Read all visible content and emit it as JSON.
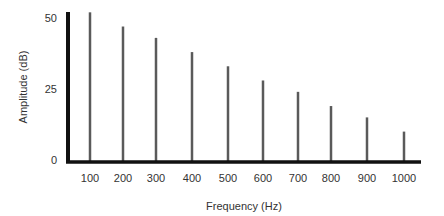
{
  "chart_data": {
    "type": "bar",
    "subtype": "stem",
    "title": "",
    "xlabel": "Frequency (Hz)",
    "ylabel": "Amplitude (dB)",
    "categories": [
      "100",
      "200",
      "300",
      "400",
      "500",
      "600",
      "700",
      "800",
      "900",
      "1000"
    ],
    "values": [
      52,
      47,
      43,
      38,
      33,
      28,
      24,
      19,
      15,
      10
    ],
    "yticks": [
      0,
      25,
      50
    ],
    "ylim": [
      0,
      52
    ],
    "grid": false,
    "legend": null,
    "colors": {
      "stem": "#5a5a5a",
      "axis": "#111111",
      "text": "#333333"
    }
  }
}
